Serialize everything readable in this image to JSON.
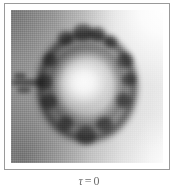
{
  "figure": {
    "type": "fractal-image",
    "frame": {
      "border_color": "#9a9a9a",
      "background_color": "#ffffff"
    },
    "image": {
      "palette": "grayscale",
      "dark_color": "#121212",
      "mid_color": "#9a9a9a",
      "light_color": "#ffffff",
      "structure": "dark lumpy annulus with bright interior, bright upper-right background, darker lower-left background, thin tendril extending to the left edge"
    },
    "caption": {
      "symbol": "τ",
      "equals": "=",
      "value": "0",
      "full_text": "τ = 0"
    }
  }
}
